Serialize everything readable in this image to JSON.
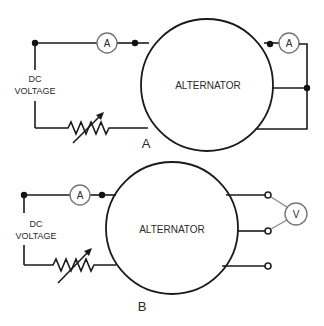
{
  "diagrams": [
    {
      "id": "A",
      "label": "A",
      "source_label_line1": "DC",
      "source_label_line2": "VOLTAGE",
      "machine_label": "ALTERNATOR",
      "field_meter_label": "A",
      "output_meter_label": "A",
      "output_connection": "shorted output with ammeter"
    },
    {
      "id": "B",
      "label": "B",
      "source_label_line1": "DC",
      "source_label_line2": "VOLTAGE",
      "machine_label": "ALTERNATOR",
      "field_meter_label": "A",
      "output_meter_label": "V",
      "output_connection": "open terminals with voltmeter"
    }
  ],
  "icons": {
    "ammeter": "circle-A",
    "voltmeter": "circle-V",
    "rheostat": "variable-resistor-zigzag-arrow",
    "junction": "filled-dot",
    "terminal": "open-circle"
  },
  "colors": {
    "line": "#1a1a1a",
    "meter_outline": "#777777",
    "text": "#2a2a2a",
    "background": "#ffffff"
  }
}
